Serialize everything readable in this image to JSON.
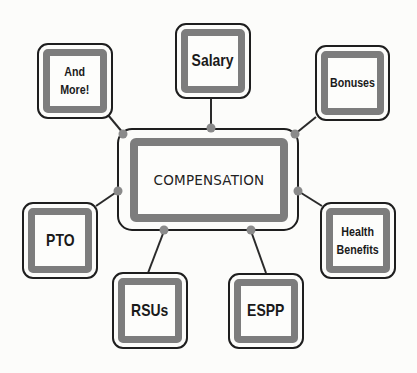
{
  "diagram": {
    "type": "hub-and-spoke mind map",
    "center": {
      "label": "COMPENSATION"
    },
    "nodes": [
      {
        "id": "salary",
        "label": "Salary"
      },
      {
        "id": "bonuses",
        "label": "Bonuses"
      },
      {
        "id": "health-benefits",
        "label": "Health\nBenefits"
      },
      {
        "id": "espp",
        "label": "ESPP"
      },
      {
        "id": "rsus",
        "label": "RSUs"
      },
      {
        "id": "pto",
        "label": "PTO"
      },
      {
        "id": "and-more",
        "label": "And\nMore!"
      }
    ],
    "colors": {
      "background": "#fcfcfa",
      "outline": "#1e1e1e",
      "frame_gray": "#7d7d7d",
      "connector_dot": "#8a8a8a"
    }
  }
}
